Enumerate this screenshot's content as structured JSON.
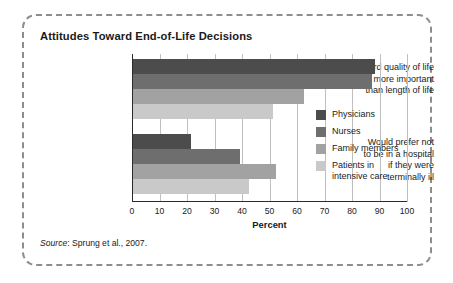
{
  "figure": {
    "title": "Attitudes Toward End-of-Life Decisions",
    "source_prefix": "Source",
    "source_rest": ": Sprung et al., 2007."
  },
  "chart_data": {
    "type": "bar",
    "orientation": "horizontal",
    "title": "Attitudes Toward End-of-Life Decisions",
    "xlabel": "Percent",
    "ylabel": "",
    "xlim": [
      0,
      100
    ],
    "xticks": [
      0,
      10,
      20,
      30,
      40,
      50,
      60,
      70,
      80,
      90,
      100
    ],
    "grid": true,
    "legend_position": "center-right",
    "categories": [
      "Regard quality of life as more important than length of life",
      "Would prefer not to be in a hospital if they were terminally ill"
    ],
    "category_lines": [
      [
        "Regard quality of life",
        "as more important",
        "than length of life"
      ],
      [
        "Would prefer not",
        "to be in a hospital",
        "if they were",
        "terminally ill"
      ]
    ],
    "series": [
      {
        "name": "Physicians",
        "color": "#4c4c4c",
        "values": [
          88,
          21
        ]
      },
      {
        "name": "Nurses",
        "color": "#6e6e6e",
        "values": [
          87,
          39
        ]
      },
      {
        "name": "Family members",
        "color": "#a2a2a2",
        "values": [
          62,
          52
        ]
      },
      {
        "name": "Patients in intensive care",
        "color": "#c9c9c9",
        "values": [
          51,
          42
        ]
      }
    ],
    "legend_lines": [
      [
        "Physicians"
      ],
      [
        "Nurses"
      ],
      [
        "Family members"
      ],
      [
        "Patients in",
        "intensive care"
      ]
    ]
  }
}
